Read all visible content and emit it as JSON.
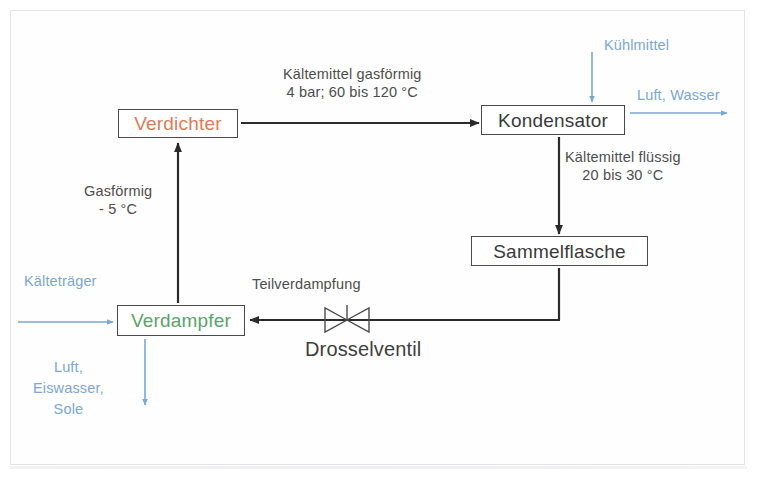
{
  "diagram": {
    "nodes": [
      {
        "id": "verdichter",
        "label": "Verdichter",
        "color": "#e07a55"
      },
      {
        "id": "kondensator",
        "label": "Kondensator",
        "color": "#3a3a3a"
      },
      {
        "id": "sammelflasche",
        "label": "Sammelflasche",
        "color": "#3a3a3a"
      },
      {
        "id": "verdampfer",
        "label": "Verdampfer",
        "color": "#5aa36a"
      }
    ],
    "labels": {
      "kaeltemittel_gasfoermig_line1": "Kältemittel gasförmig",
      "kaeltemittel_gasfoermig_line2": "4 bar; 60 bis 120 °C",
      "kuehlmittel": "Kühlmittel",
      "luft_wasser": "Luft, Wasser",
      "kaeltemittel_fluessig_line1": "Kältemittel flüssig",
      "kaeltemittel_fluessig_line2": "20 bis 30 °C",
      "gasfoermig_line1": "Gasförmig",
      "gasfoermig_line2": "- 5 °C",
      "kaeltetraeger": "Kälteträger",
      "teilverdampfung": "Teilverdampfung",
      "drosselventil": "Drosselventil",
      "luft_eiswasser_sole_line1": "Luft,",
      "luft_eiswasser_sole_line2": "Eiswasser,",
      "luft_eiswasser_sole_line3": "Sole"
    },
    "colors": {
      "refrigerant_flow": "#2b2b2b",
      "coolant_flow": "#7ba7d7",
      "compressor_text": "#e07a55",
      "evaporator_text": "#5aa36a",
      "box_border": "#4a4a4a",
      "frame_border": "#e3e4e6",
      "body_text": "#4d4d4d"
    },
    "icons": {
      "valve": "throttle-valve-icon"
    }
  }
}
